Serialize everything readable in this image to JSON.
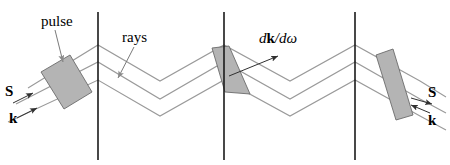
{
  "figure": {
    "type": "optics-ray-diagram",
    "width": 450,
    "height": 165,
    "background": "#ffffff",
    "colors": {
      "ray_line": "#9a9a9a",
      "pulse_fill": "#b4b4b4",
      "pulse_stroke": "#6b6b6b",
      "boundary_line": "#1a1a1a",
      "text": "#000000",
      "leader_line": "#7a7a7a"
    }
  },
  "labels": {
    "pulse": "pulse",
    "rays": "rays",
    "dkdomega_d1": "d",
    "dkdomega_k": "k",
    "dkdomega_slash": "/",
    "dkdomega_d2": "d",
    "dkdomega_omega": "ω",
    "s_left": "S",
    "k_left": "k",
    "s_right": "S",
    "k_right": "k"
  },
  "boundaries": [
    {
      "name": "boundary-1",
      "x": 98,
      "y1": 12,
      "y2": 160
    },
    {
      "name": "boundary-2",
      "x": 224,
      "y1": 12,
      "y2": 160
    },
    {
      "name": "boundary-3",
      "x": 355,
      "y1": 12,
      "y2": 160
    }
  ],
  "rays": [
    {
      "name": "ray-top",
      "points": "28,88 98,45 160,81 224,45 290,81 355,45 420,81 446,97"
    },
    {
      "name": "ray-middle",
      "points": "16,104 98,62 160,99 224,62 290,99 355,62 420,99 446,113"
    },
    {
      "name": "ray-bottom",
      "points": "8,122 98,80 160,116 224,80 290,116 355,80 420,116 446,130"
    }
  ],
  "pulses": [
    {
      "name": "pulse-left",
      "points": "41,72 70,55 92,92 64,109",
      "note": "near-rectangular wavefront slab"
    },
    {
      "name": "pulse-middle",
      "points": "212,48 229,46 250,94 225,92",
      "note": "sheared slab at second boundary"
    },
    {
      "name": "pulse-right",
      "points": "376,55 393,49 413,115 396,120",
      "note": "narrow tilted slab at third boundary"
    }
  ],
  "leaders": [
    {
      "name": "leader-pulse",
      "from": [
        55,
        30
      ],
      "to": [
        62,
        62
      ]
    },
    {
      "name": "leader-rays",
      "from": [
        133,
        47
      ],
      "to": [
        118,
        78
      ]
    }
  ],
  "arrows": [
    {
      "name": "arrow-dkdw",
      "from": [
        229,
        75
      ],
      "to": [
        278,
        56
      ],
      "note": "group-velocity direction dk/domega"
    },
    {
      "name": "arrow-s-left",
      "from": [
        14,
        103
      ],
      "to": [
        32,
        94
      ]
    },
    {
      "name": "arrow-k-left",
      "from": [
        18,
        117
      ],
      "to": [
        36,
        108
      ]
    },
    {
      "name": "arrow-s-right",
      "from": [
        412,
        98
      ],
      "to": [
        431,
        103
      ]
    },
    {
      "name": "arrow-k-right",
      "from": [
        429,
        112
      ],
      "to": [
        413,
        105
      ]
    }
  ]
}
